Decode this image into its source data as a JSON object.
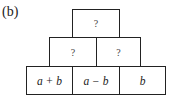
{
  "figure_label": "(b)",
  "pyramid": {
    "rows": [
      {
        "cells": [
          "?"
        ]
      },
      {
        "cells": [
          "?",
          "?"
        ]
      },
      {
        "cells": [
          "a + b",
          "a − b",
          "b"
        ]
      }
    ]
  }
}
